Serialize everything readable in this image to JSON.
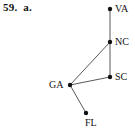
{
  "figure": {
    "problem_number": "59.",
    "part_letter": "a.",
    "caption": "59.  a."
  },
  "style": {
    "background": "#ffffff",
    "edge_color": "#595959",
    "node_color": "#111111",
    "text_color": "#111111",
    "node_radius": 2.2,
    "edge_width": 1
  },
  "chart_data": {
    "type": "graph",
    "title": "59.  a.",
    "nodes": [
      {
        "id": "VA",
        "label": "VA",
        "x": 110,
        "y": 9,
        "label_dx": 5,
        "label_dy": -5,
        "label_side": "right"
      },
      {
        "id": "NC",
        "label": "NC",
        "x": 110,
        "y": 42,
        "label_dx": 5,
        "label_dy": -5,
        "label_side": "right"
      },
      {
        "id": "SC",
        "label": "SC",
        "x": 110,
        "y": 77,
        "label_dx": 5,
        "label_dy": -5,
        "label_side": "right"
      },
      {
        "id": "GA",
        "label": "GA",
        "x": 70,
        "y": 85,
        "label_dx": -21,
        "label_dy": -5,
        "label_side": "left"
      },
      {
        "id": "FL",
        "label": "FL",
        "x": 86,
        "y": 113,
        "label_dx": -1,
        "label_dy": 5,
        "label_side": "below"
      }
    ],
    "edges": [
      {
        "source": "VA",
        "target": "NC"
      },
      {
        "source": "NC",
        "target": "SC"
      },
      {
        "source": "NC",
        "target": "GA"
      },
      {
        "source": "SC",
        "target": "GA"
      },
      {
        "source": "GA",
        "target": "FL"
      }
    ],
    "node_count": 5,
    "edge_count": 5
  }
}
